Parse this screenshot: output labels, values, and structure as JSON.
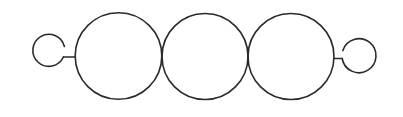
{
  "diagram": {
    "stroke_color": "#2a2a2a",
    "stroke_width": 1.6,
    "background": "#ffffff",
    "large_circles": [
      {
        "cx": 118.5,
        "cy": 56,
        "r": 43.3
      },
      {
        "cx": 205,
        "cy": 56.5,
        "r": 43
      },
      {
        "cx": 291,
        "cy": 56.5,
        "r": 43
      }
    ],
    "left_hook": {
      "ring": {
        "cx": 49,
        "cy": 50.5,
        "r": 16
      },
      "arc_start": [
        64.4,
        46.5
      ],
      "arc_end": [
        63.4,
        57
      ],
      "stem": {
        "x1": 63.4,
        "y1": 57,
        "x2": 75.2,
        "y2": 57
      }
    },
    "right_hook": {
      "ring": {
        "cx": 359,
        "cy": 55.5,
        "r": 17
      },
      "arc_start": [
        342.8,
        50.5
      ],
      "arc_end": [
        342.2,
        58.5
      ],
      "stem": {
        "x1": 334,
        "y1": 58.5,
        "x2": 342.2,
        "y2": 58.5
      }
    }
  }
}
